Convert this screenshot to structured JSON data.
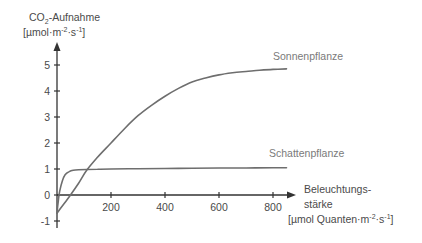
{
  "chart_data": {
    "type": "line",
    "title": "",
    "ylabel": {
      "line1_prefix": "CO",
      "line1_sub": "2",
      "line1_suffix": "-Aufnahme",
      "line2_a": "[µmol·m",
      "line2_sup1": "-2",
      "line2_b": "·s",
      "line2_sup2": "-1",
      "line2_c": "]",
      "full": "CO2-Aufnahme [µmol·m-2·s-1]"
    },
    "xlabel": {
      "line1": "Beleuchtungs-",
      "line2": "stärke",
      "line3_a": "[µmol Quanten·m",
      "line3_sup1": "-2",
      "line3_b": "·s",
      "line3_sup2": "-1",
      "line3_c": "]",
      "full": "Beleuchtungsstärke [µmol Quanten·m-2·s-1]"
    },
    "xlim": [
      0,
      860
    ],
    "ylim": [
      -1.2,
      5.5
    ],
    "x_ticks": [
      200,
      400,
      600,
      800
    ],
    "x_tick_labels": [
      "200",
      "400",
      "600",
      "800"
    ],
    "y_ticks": [
      5,
      4,
      3,
      2,
      1,
      0,
      -1
    ],
    "y_tick_labels": [
      "5",
      "4",
      "3",
      "2",
      "1",
      "0",
      "-1"
    ],
    "grid": false,
    "legend": "inline labels at right end of curves",
    "series": [
      {
        "name": "Sonnenpflanze",
        "color": "#6e6e6e",
        "x": [
          0,
          25,
          50,
          80,
          110,
          150,
          200,
          250,
          300,
          350,
          400,
          450,
          500,
          550,
          600,
          650,
          700,
          750,
          800,
          850
        ],
        "y": [
          -0.7,
          -0.35,
          0.0,
          0.45,
          0.95,
          1.45,
          2.0,
          2.55,
          3.05,
          3.45,
          3.8,
          4.1,
          4.35,
          4.5,
          4.62,
          4.7,
          4.75,
          4.8,
          4.83,
          4.85
        ]
      },
      {
        "name": "Schattenpflanze",
        "color": "#6e6e6e",
        "x": [
          0,
          5,
          10,
          20,
          30,
          45,
          60,
          80,
          110,
          150,
          200,
          300,
          400,
          500,
          600,
          700,
          800,
          850
        ],
        "y": [
          -0.7,
          -0.2,
          0.15,
          0.55,
          0.78,
          0.9,
          0.95,
          0.97,
          0.98,
          0.99,
          1.0,
          1.01,
          1.02,
          1.03,
          1.04,
          1.04,
          1.05,
          1.05
        ]
      }
    ]
  }
}
